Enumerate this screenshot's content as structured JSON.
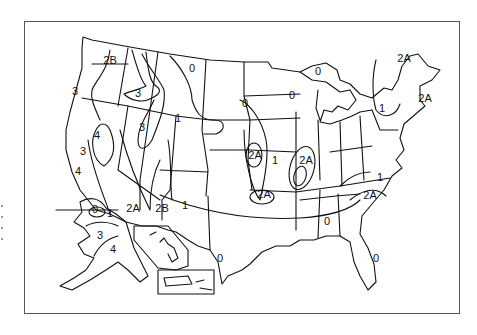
{
  "map": {
    "subject": "US seismic zone map",
    "stroke_color": "#111111",
    "background": "#ffffff",
    "zone_labels": [
      {
        "text": "2B",
        "x": 110,
        "y": 64
      },
      {
        "text": "0",
        "x": 192,
        "y": 72
      },
      {
        "text": "3",
        "x": 75,
        "y": 95
      },
      {
        "text": "3",
        "x": 138,
        "y": 97
      },
      {
        "text": "1",
        "x": 178,
        "y": 122
      },
      {
        "text": "4",
        "x": 97,
        "y": 139
      },
      {
        "text": "3",
        "x": 142,
        "y": 131
      },
      {
        "text": "3",
        "x": 83,
        "y": 155
      },
      {
        "text": "4",
        "x": 78,
        "y": 175
      },
      {
        "text": "0",
        "x": 245,
        "y": 107
      },
      {
        "text": "0",
        "x": 292,
        "y": 99
      },
      {
        "text": "0",
        "x": 318,
        "y": 75
      },
      {
        "text": "1",
        "x": 382,
        "y": 112
      },
      {
        "text": "2A",
        "x": 404,
        "y": 62
      },
      {
        "text": "2A",
        "x": 425,
        "y": 102
      },
      {
        "text": "2A",
        "x": 255,
        "y": 159
      },
      {
        "text": "1",
        "x": 275,
        "y": 164
      },
      {
        "text": "2A",
        "x": 306,
        "y": 164
      },
      {
        "text": "2A",
        "x": 264,
        "y": 198
      },
      {
        "text": "2A",
        "x": 370,
        "y": 199
      },
      {
        "text": "1",
        "x": 380,
        "y": 181
      },
      {
        "text": "0",
        "x": 327,
        "y": 225
      },
      {
        "text": "0",
        "x": 376,
        "y": 262
      },
      {
        "text": "0",
        "x": 220,
        "y": 262
      },
      {
        "text": "1",
        "x": 185,
        "y": 209
      },
      {
        "text": "2B",
        "x": 162,
        "y": 212
      },
      {
        "text": "2A",
        "x": 133,
        "y": 212
      },
      {
        "text": "1",
        "x": 110,
        "y": 217
      },
      {
        "text": "0",
        "x": 95,
        "y": 213
      },
      {
        "text": "3",
        "x": 100,
        "y": 239
      },
      {
        "text": "4",
        "x": 113,
        "y": 253
      }
    ]
  }
}
